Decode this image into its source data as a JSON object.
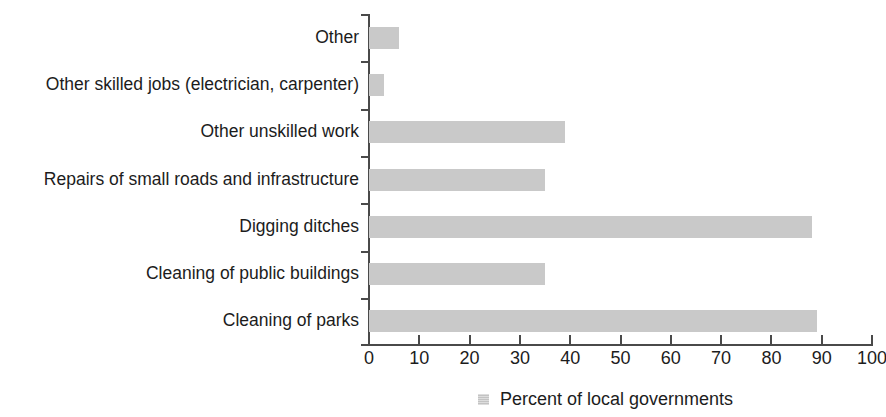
{
  "chart_data": {
    "type": "bar",
    "orientation": "horizontal",
    "title": "",
    "xlabel": "",
    "ylabel": "",
    "xlim": [
      0,
      100
    ],
    "xticks": [
      0,
      10,
      20,
      30,
      40,
      50,
      60,
      70,
      80,
      90,
      100
    ],
    "grid": false,
    "legend_position": "bottom",
    "legend": [
      "Percent of local governments"
    ],
    "series_color": "#c9c9c9",
    "axis_color": "#4a4a4a",
    "categories": [
      "Other",
      "Other skilled jobs (electrician, carpenter)",
      "Other unskilled work",
      "Repairs of small roads and infrastructure",
      "Digging ditches",
      "Cleaning of public buildings",
      "Cleaning of parks"
    ],
    "series": [
      {
        "name": "Percent of local governments",
        "values": [
          6,
          3,
          39,
          35,
          88,
          35,
          89
        ]
      }
    ]
  }
}
